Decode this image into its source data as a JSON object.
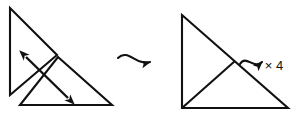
{
  "diagram": {
    "background_color": "#ffffff",
    "stroke_color": "#111111",
    "left_figure": {
      "name": "two-overlapping-triangles",
      "description": "Two congruent right triangles overlapping, with a double-headed arrow across them",
      "upper_triangle": {
        "points": "10,8 10,95 57,55"
      },
      "lower_triangle": {
        "points": "20,105 112,105 58,57"
      },
      "double_arrow": {
        "from_x": 26,
        "from_y": 57,
        "to_x": 68,
        "to_y": 98,
        "heads": 2
      }
    },
    "middle_arrow": {
      "name": "curved-transform-arrow",
      "from_x": 118,
      "from_y": 58,
      "to_x": 160,
      "to_y": 63
    },
    "right_figure": {
      "name": "combined-triangle",
      "description": "Single large right triangle subdivided into two smaller triangles",
      "outer_triangle": {
        "points": "182,15 182,108 288,108"
      },
      "inner_lines": [
        {
          "x1": 182,
          "y1": 108,
          "x2": 235,
          "y2": 61
        }
      ]
    },
    "right_arrow": {
      "name": "curved-multiply-arrow",
      "from_x": 240,
      "from_y": 62,
      "to_x": 268,
      "to_y": 61
    },
    "multiplier_label": {
      "text": "× 4",
      "x": 274,
      "y": 66
    }
  }
}
